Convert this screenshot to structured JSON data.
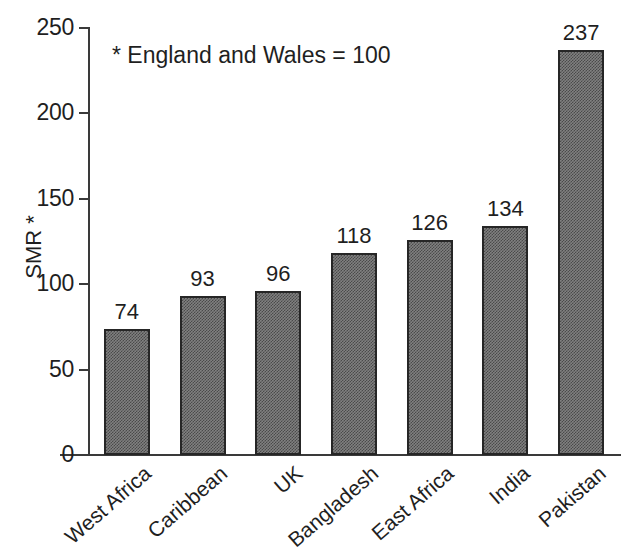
{
  "chart_data": {
    "type": "bar",
    "title": "",
    "subtitle": "",
    "annotation": "* England and Wales = 100",
    "xlabel": "",
    "ylabel": "SMR *",
    "ylim": [
      0,
      250
    ],
    "ytick_values": [
      0,
      50,
      100,
      150,
      200,
      250
    ],
    "ytick_labels": [
      "0",
      "50",
      "100",
      "150",
      "200",
      "250"
    ],
    "grid": false,
    "legend": null,
    "categories": [
      "West Africa",
      "Caribbean",
      "UK",
      "Bangladesh",
      "East Africa",
      "India",
      "Pakistan"
    ],
    "values": [
      74,
      93,
      96,
      118,
      126,
      134,
      237
    ],
    "value_labels": [
      "74",
      "93",
      "96",
      "118",
      "126",
      "134",
      "237"
    ],
    "bar_fill": "#808080",
    "bar_pattern": "fine-checker-dither",
    "bar_edge_color": "#262626",
    "axis_color": "#3a3a3a",
    "text_color": "#1f1f1f",
    "background": "#ffffff"
  }
}
